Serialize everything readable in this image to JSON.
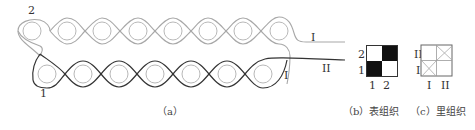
{
  "figure_a": {
    "caption": "（a）",
    "labels": {
      "top_start": "2",
      "bottom_start": "1",
      "top_end": "I",
      "bottom_end_loop": "I",
      "bottom_end": "II"
    },
    "colors": {
      "top_yarn": "#a8a8a8",
      "bottom_yarn": "#333333",
      "needle_circle": "#b0b0b0"
    },
    "top_row_circles": 8,
    "bottom_row_circles": 7
  },
  "figure_b": {
    "caption": "（b）表组织",
    "row_labels": [
      "2",
      "1"
    ],
    "col_labels": [
      "1",
      "2"
    ],
    "grid": [
      [
        "white",
        "black"
      ],
      [
        "black",
        "white"
      ]
    ]
  },
  "figure_c": {
    "caption": "（c）里组织",
    "row_labels": [
      "II",
      "I"
    ],
    "col_labels": [
      "I",
      "II"
    ],
    "grid": [
      [
        "empty",
        "cross"
      ],
      [
        "cross",
        "empty"
      ]
    ]
  }
}
